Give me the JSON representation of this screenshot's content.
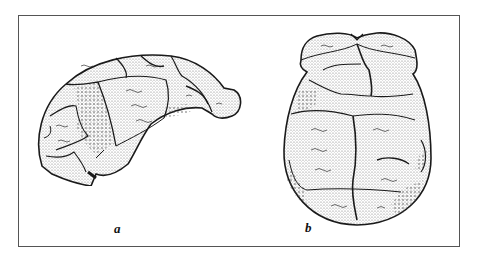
{
  "figure": {
    "views": [
      {
        "id": "a",
        "label": "a",
        "description": "lateral view"
      },
      {
        "id": "b",
        "label": "b",
        "description": "superior (top) view"
      }
    ],
    "colors": {
      "ink": "#1a1a1a",
      "stipple": "#444444",
      "paper": "#ffffff",
      "border": "#555555"
    }
  }
}
